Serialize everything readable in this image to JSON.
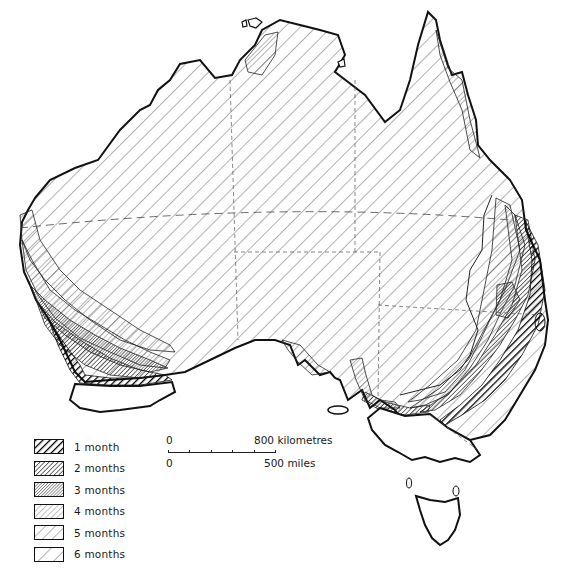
{
  "map": {
    "region": "Australia",
    "background": "#ffffff",
    "ink_color": "#111111"
  },
  "legend": {
    "items": [
      {
        "label": "1 month",
        "pattern": "heavy-diagonal"
      },
      {
        "label": "2 months",
        "pattern": "dense-diagonal"
      },
      {
        "label": "3 months",
        "pattern": "very-dense-diagonal"
      },
      {
        "label": "4 months",
        "pattern": "fine-diagonal"
      },
      {
        "label": "5 months",
        "pattern": "medium-diagonal"
      },
      {
        "label": "6 months",
        "pattern": "sparse-diagonal"
      }
    ]
  },
  "scale": {
    "km_start": "0",
    "km_end": "800 kilometres",
    "mi_start": "0",
    "mi_end": "500 miles"
  }
}
